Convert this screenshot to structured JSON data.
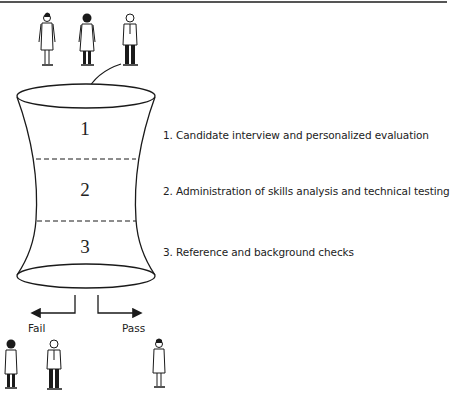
{
  "diagram": {
    "title": "",
    "funnel": {
      "stages": [
        {
          "number": "1",
          "label": "1.  Candidate interview and personalized evaluation"
        },
        {
          "number": "2",
          "label": "2.  Administration of skills analysis and technical testing"
        },
        {
          "number": "3",
          "label": "3.  Reference and background checks"
        }
      ]
    },
    "input_candidates": 3,
    "outcomes": {
      "fail_label": "Fail",
      "pass_label": "Pass",
      "fail_count": 2,
      "pass_count": 1
    },
    "colors": {
      "stroke": "#1a1a1a",
      "background": "#ffffff"
    }
  }
}
